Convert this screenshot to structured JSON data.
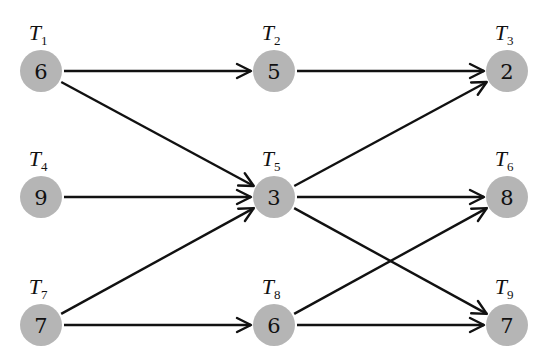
{
  "diagram": {
    "type": "task-dependency-graph",
    "node_fill": "#b5b5b5",
    "edge_color": "#111111",
    "node_radius": 21,
    "nodes": [
      {
        "id": "T1",
        "label": "T",
        "sub": "1",
        "value": "6",
        "x": 41,
        "y": 71
      },
      {
        "id": "T2",
        "label": "T",
        "sub": "2",
        "value": "5",
        "x": 274,
        "y": 71
      },
      {
        "id": "T3",
        "label": "T",
        "sub": "3",
        "value": "2",
        "x": 507,
        "y": 71
      },
      {
        "id": "T4",
        "label": "T",
        "sub": "4",
        "value": "9",
        "x": 41,
        "y": 197
      },
      {
        "id": "T5",
        "label": "T",
        "sub": "5",
        "value": "3",
        "x": 274,
        "y": 197
      },
      {
        "id": "T6",
        "label": "T",
        "sub": "6",
        "value": "8",
        "x": 507,
        "y": 197
      },
      {
        "id": "T7",
        "label": "T",
        "sub": "7",
        "value": "7",
        "x": 41,
        "y": 325
      },
      {
        "id": "T8",
        "label": "T",
        "sub": "8",
        "value": "6",
        "x": 274,
        "y": 325
      },
      {
        "id": "T9",
        "label": "T",
        "sub": "9",
        "value": "7",
        "x": 507,
        "y": 325
      }
    ],
    "edges": [
      {
        "from": "T1",
        "to": "T2"
      },
      {
        "from": "T1",
        "to": "T5"
      },
      {
        "from": "T2",
        "to": "T3"
      },
      {
        "from": "T4",
        "to": "T5"
      },
      {
        "from": "T5",
        "to": "T3"
      },
      {
        "from": "T5",
        "to": "T6"
      },
      {
        "from": "T5",
        "to": "T9"
      },
      {
        "from": "T7",
        "to": "T5"
      },
      {
        "from": "T7",
        "to": "T8"
      },
      {
        "from": "T8",
        "to": "T6"
      },
      {
        "from": "T8",
        "to": "T9"
      }
    ]
  }
}
